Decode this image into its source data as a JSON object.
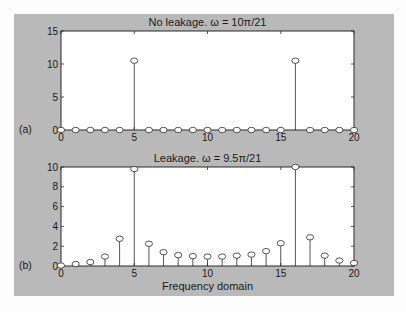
{
  "chart_data": [
    {
      "type": "stem",
      "panel_label": "(a)",
      "title": "No leakage. ω = 10π/21",
      "xlabel": "",
      "ylabel": "",
      "xlim": [
        0,
        20
      ],
      "ylim": [
        0,
        15
      ],
      "xticks": [
        0,
        5,
        10,
        15,
        20
      ],
      "yticks": [
        0,
        5,
        10,
        15
      ],
      "x": [
        0,
        1,
        2,
        3,
        4,
        5,
        6,
        7,
        8,
        9,
        10,
        11,
        12,
        13,
        14,
        15,
        16,
        17,
        18,
        19,
        20
      ],
      "values": [
        0,
        0,
        0,
        0,
        0,
        10.5,
        0,
        0,
        0,
        0,
        0,
        0,
        0,
        0,
        0,
        0,
        10.5,
        0,
        0,
        0,
        0
      ],
      "grid": false,
      "marker": "open-circle"
    },
    {
      "type": "stem",
      "panel_label": "(b)",
      "title": "Leakage. ω = 9.5π/21",
      "xlabel": "Frequency domain",
      "ylabel": "",
      "xlim": [
        0,
        20
      ],
      "ylim": [
        0,
        10
      ],
      "xticks": [
        0,
        5,
        10,
        15,
        20
      ],
      "yticks": [
        0,
        2,
        4,
        6,
        8,
        10
      ],
      "x": [
        0,
        1,
        2,
        3,
        4,
        5,
        6,
        7,
        8,
        9,
        10,
        11,
        12,
        13,
        14,
        15,
        16,
        17,
        18,
        19,
        20
      ],
      "values": [
        0.05,
        0.2,
        0.4,
        0.95,
        2.75,
        9.8,
        2.25,
        1.4,
        1.1,
        1.0,
        0.95,
        0.95,
        1.05,
        1.15,
        1.5,
        2.3,
        10.0,
        2.9,
        1.05,
        0.55,
        0.3
      ],
      "grid": false,
      "marker": "open-circle"
    }
  ],
  "colors": {
    "figure_background": "#b9b9b9",
    "axes_background": "#ffffff",
    "line": "#2a2a2a"
  }
}
